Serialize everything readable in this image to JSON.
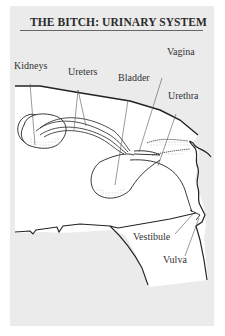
{
  "title": "THE BITCH: URINARY SYSTEM",
  "labels": {
    "kidneys": "Kidneys",
    "ureters": "Ureters",
    "bladder": "Bladder",
    "vagina": "Vagina",
    "urethra": "Urethra",
    "vestibule": "Vestibule",
    "vulva": "Vulva"
  },
  "colors": {
    "card_bg": "#ebebeb",
    "body_fill": "#ffffff",
    "outline": "#222222",
    "leader": "#555555"
  }
}
